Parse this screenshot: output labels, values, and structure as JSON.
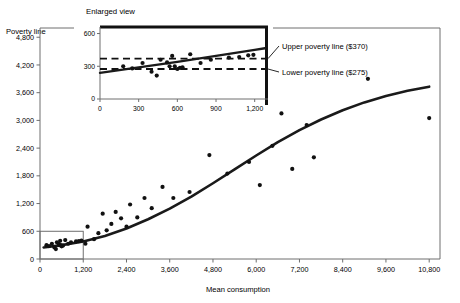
{
  "chart_data": {
    "type": "scatter",
    "title": "",
    "xlabel": "Mean consumption",
    "ylabel": "Poverty line",
    "xlim": [
      0,
      11100
    ],
    "ylim": [
      0,
      5000
    ],
    "xticks": [
      0,
      1200,
      2400,
      3600,
      4800,
      6000,
      7200,
      8400,
      9600,
      10800
    ],
    "xtick_labels": [
      "0",
      "1,200",
      "2,400",
      "3,600",
      "4,800",
      "6,000",
      "7,200",
      "8,400",
      "9,600",
      "10,800"
    ],
    "yticks": [
      0,
      600,
      1200,
      1800,
      2400,
      3000,
      3600,
      4200,
      4800
    ],
    "ytick_labels": [
      "0",
      "600",
      "1,200",
      "1,800",
      "2,400",
      "3,000",
      "3,600",
      "4,200",
      "4,800"
    ],
    "grid": false,
    "legend": "none",
    "points": [
      [
        180,
        300
      ],
      [
        250,
        280
      ],
      [
        330,
        330
      ],
      [
        400,
        250
      ],
      [
        440,
        215
      ],
      [
        470,
        360
      ],
      [
        520,
        330
      ],
      [
        540,
        300
      ],
      [
        560,
        395
      ],
      [
        580,
        300
      ],
      [
        600,
        275
      ],
      [
        640,
        290
      ],
      [
        700,
        410
      ],
      [
        780,
        330
      ],
      [
        860,
        360
      ],
      [
        1000,
        380
      ],
      [
        1080,
        385
      ],
      [
        1150,
        400
      ],
      [
        1260,
        330
      ],
      [
        1320,
        700
      ],
      [
        1500,
        430
      ],
      [
        1620,
        560
      ],
      [
        1740,
        980
      ],
      [
        1850,
        620
      ],
      [
        1980,
        760
      ],
      [
        2100,
        1020
      ],
      [
        2250,
        880
      ],
      [
        2400,
        700
      ],
      [
        2500,
        1180
      ],
      [
        2700,
        900
      ],
      [
        2900,
        1320
      ],
      [
        3100,
        1100
      ],
      [
        3400,
        1560
      ],
      [
        3700,
        1320
      ],
      [
        4150,
        1450
      ],
      [
        4700,
        2250
      ],
      [
        5200,
        1850
      ],
      [
        5800,
        2100
      ],
      [
        6100,
        1600
      ],
      [
        6450,
        2450
      ],
      [
        6700,
        3150
      ],
      [
        7000,
        1950
      ],
      [
        7400,
        2900
      ],
      [
        7600,
        2200
      ],
      [
        9100,
        3900
      ],
      [
        10800,
        3050
      ]
    ],
    "curve": {
      "description": "Fitted sigmoid-shaped regression curve of poverty line versus mean consumption",
      "points": [
        [
          100,
          250
        ],
        [
          600,
          300
        ],
        [
          1200,
          380
        ],
        [
          1800,
          500
        ],
        [
          2400,
          660
        ],
        [
          3000,
          860
        ],
        [
          3600,
          1090
        ],
        [
          4200,
          1350
        ],
        [
          4800,
          1640
        ],
        [
          5400,
          1940
        ],
        [
          6000,
          2240
        ],
        [
          6600,
          2530
        ],
        [
          7200,
          2790
        ],
        [
          7800,
          3020
        ],
        [
          8400,
          3220
        ],
        [
          9000,
          3390
        ],
        [
          9600,
          3530
        ],
        [
          10200,
          3640
        ],
        [
          10800,
          3730
        ]
      ]
    },
    "inset": {
      "title": "Enlarged view",
      "xlim": [
        0,
        1280
      ],
      "ylim": [
        0,
        660
      ],
      "xticks": [
        0,
        300,
        600,
        900,
        1200
      ],
      "xtick_labels": [
        "0",
        "300",
        "600",
        "900",
        "1,200"
      ],
      "yticks": [
        0,
        300,
        600
      ],
      "ytick_labels": [
        "0",
        "300",
        "600"
      ],
      "points": [
        [
          180,
          300
        ],
        [
          250,
          280
        ],
        [
          330,
          330
        ],
        [
          400,
          250
        ],
        [
          440,
          215
        ],
        [
          470,
          360
        ],
        [
          520,
          335
        ],
        [
          540,
          300
        ],
        [
          560,
          395
        ],
        [
          580,
          300
        ],
        [
          600,
          275
        ],
        [
          620,
          285
        ],
        [
          640,
          290
        ],
        [
          700,
          410
        ],
        [
          780,
          330
        ],
        [
          860,
          360
        ],
        [
          1000,
          380
        ],
        [
          1080,
          385
        ],
        [
          1150,
          400
        ],
        [
          1190,
          405
        ]
      ],
      "curve": [
        [
          0,
          240
        ],
        [
          300,
          290
        ],
        [
          600,
          340
        ],
        [
          900,
          395
        ],
        [
          1200,
          450
        ],
        [
          1280,
          465
        ]
      ],
      "reference_lines": [
        {
          "name": "upper-poverty-line",
          "value": 370,
          "label": "Upper poverty line ($370)",
          "style": "dashed"
        },
        {
          "name": "lower-poverty-line",
          "value": 275,
          "label": "Lower poverty line ($275)",
          "style": "dashed"
        }
      ]
    },
    "zoom_box": {
      "x0": 0,
      "x1": 1200,
      "y0": 0,
      "y1": 600
    }
  },
  "colors": {
    "axis": "#6e6e6e",
    "data": "#111111",
    "curve": "#1a1a1a",
    "background": "#ffffff"
  }
}
